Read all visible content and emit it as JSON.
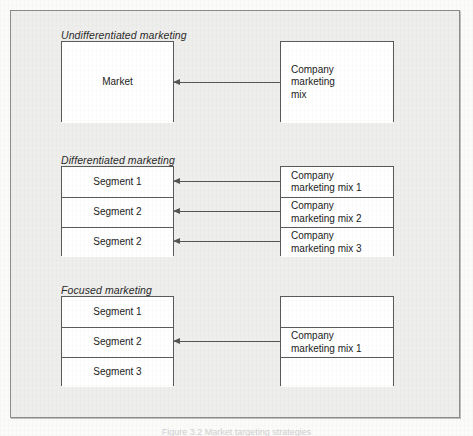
{
  "figure": {
    "caption": "Figure 3.2  Market targeting strategies",
    "background_color": "#eeeeec",
    "frame_border_color": "#8b8b8b",
    "box_border_color": "#5a5a5a",
    "box_fill_color": "#ffffff",
    "arrow_color": "#555555",
    "text_color": "#1c1c1c"
  },
  "sections": [
    {
      "label": "Undifferentiated marketing",
      "left_box": {
        "name": "market-box",
        "rows": [
          {
            "text": "Market"
          }
        ]
      },
      "right_box": {
        "name": "company-marketing-mix-box",
        "rows": [
          {
            "text": "Company\nmarketing\nmix"
          }
        ]
      },
      "arrows": [
        {
          "target_row": 0
        }
      ]
    },
    {
      "label": "Differentiated marketing",
      "left_box": {
        "name": "segments-box",
        "rows": [
          {
            "text": "Segment 1"
          },
          {
            "text": "Segment 2"
          },
          {
            "text": "Segment 2"
          }
        ]
      },
      "right_box": {
        "name": "marketing-mixes-box",
        "rows": [
          {
            "text": "Company\nmarketing mix 1"
          },
          {
            "text": "Company\nmarketing mix 2"
          },
          {
            "text": "Company\nmarketing mix 3"
          }
        ]
      },
      "arrows": [
        {
          "target_row": 0
        },
        {
          "target_row": 1
        },
        {
          "target_row": 2
        }
      ]
    },
    {
      "label": "Focused marketing",
      "left_box": {
        "name": "segments-box",
        "rows": [
          {
            "text": "Segment 1"
          },
          {
            "text": "Segment 2"
          },
          {
            "text": "Segment 3"
          }
        ]
      },
      "right_box": {
        "name": "marketing-mix-box",
        "rows": [
          {
            "text": ""
          },
          {
            "text": "Company\nmarketing mix 1"
          },
          {
            "text": ""
          }
        ]
      },
      "arrows": [
        {
          "target_row": 1
        }
      ]
    }
  ],
  "geometry": {
    "left_box_x": 60,
    "left_box_width": 113,
    "right_box_x": 279,
    "right_box_width": 114,
    "section_tops": [
      40,
      165,
      295
    ],
    "label_offsets_y": [
      -12,
      -12,
      -12
    ],
    "box_heights": [
      81,
      90,
      90
    ],
    "row_heights": [
      [
        81
      ],
      [
        30,
        30,
        30
      ],
      [
        30,
        30,
        30
      ]
    ]
  }
}
